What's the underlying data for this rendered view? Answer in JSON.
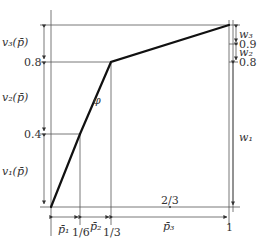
{
  "diagram": {
    "curve_label": "φ",
    "left_labels": {
      "v3": "v₃(p̄)",
      "v2": "v₂(p̄)",
      "v1": "v₁(p̄)"
    },
    "y_ticks": [
      "0.8",
      "0.4"
    ],
    "right_labels": {
      "w3": "w₃",
      "tick_09": "0.9",
      "w2": "w₂",
      "tick_08": "0.8",
      "w1": "w₁"
    },
    "bottom_labels": {
      "p1": "p̄₁",
      "one_sixth": "1/6",
      "p2": "p̄₂",
      "one_third": "1/3",
      "two_thirds": "2/3",
      "p3": "p̄₃",
      "one": "1"
    },
    "points": [
      [
        0,
        0
      ],
      [
        0.1667,
        0.4
      ],
      [
        0.3333,
        0.8
      ],
      [
        1,
        1
      ]
    ],
    "colors": {
      "line": "#111111",
      "guide": "#555555"
    }
  }
}
